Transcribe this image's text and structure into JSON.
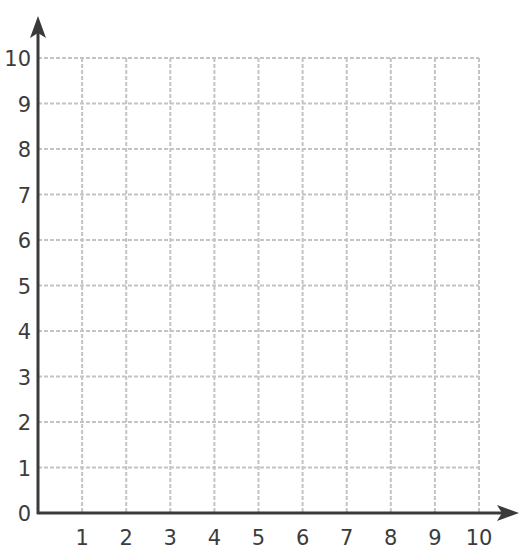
{
  "chart_data": {
    "type": "scatter",
    "title": "",
    "xlabel": "",
    "ylabel": "",
    "x_ticks": [
      0,
      1,
      2,
      3,
      4,
      5,
      6,
      7,
      8,
      9,
      10
    ],
    "y_ticks": [
      0,
      1,
      2,
      3,
      4,
      5,
      6,
      7,
      8,
      9,
      10
    ],
    "xlim": [
      0,
      10
    ],
    "ylim": [
      0,
      10
    ],
    "grid": true,
    "grid_style": "dashed",
    "series": [],
    "axes_arrows": true,
    "legend": null
  },
  "colors": {
    "axis": "#3a3a3a",
    "grid": "#c4c4c4",
    "label": "#3c3c3c",
    "background": "#ffffff"
  },
  "layout": {
    "origin_x": 38,
    "origin_y": 513,
    "unit_x": 44.1,
    "unit_y": 45.5,
    "x_arrow_tip": 519,
    "y_arrow_tip": 16
  }
}
